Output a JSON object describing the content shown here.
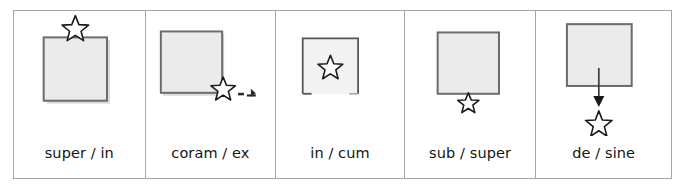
{
  "figure": {
    "type": "preposition-schema-table",
    "columns": [
      {
        "id": "col-1",
        "label": "super / in",
        "schema": "star above square",
        "star_position": "above-top-center",
        "square": {
          "fill": "#ebebeb",
          "border": "#6b6b6b",
          "shadow": true,
          "bottom_open": false
        },
        "arrow": false,
        "trail_marks": false
      },
      {
        "id": "col-2",
        "label": "coram / ex",
        "schema": "star at bottom-right corner of square with trailing marks",
        "star_position": "bottom-right-corner",
        "square": {
          "fill": "#ebebeb",
          "border": "#6b6b6b",
          "shadow": true,
          "bottom_open": false
        },
        "arrow": false,
        "trail_marks": true
      },
      {
        "id": "col-3",
        "label": "in / cum",
        "schema": "star inside square with open bottom edge",
        "star_position": "inside-center",
        "square": {
          "fill": "#f2f2f2",
          "border": "#555555",
          "shadow": false,
          "bottom_open": true
        },
        "arrow": false,
        "trail_marks": false
      },
      {
        "id": "col-4",
        "label": "sub / super",
        "schema": "star below square touching bottom edge",
        "star_position": "below-touching",
        "square": {
          "fill": "#ebebeb",
          "border": "#6b6b6b",
          "shadow": false,
          "bottom_open": false
        },
        "arrow": false,
        "trail_marks": false
      },
      {
        "id": "col-5",
        "label": "de / sine",
        "schema": "arrow from inside square pointing down to star below",
        "star_position": "below-detached",
        "square": {
          "fill": "#ebebeb",
          "border": "#6b6b6b",
          "shadow": false,
          "bottom_open": false
        },
        "arrow": true,
        "trail_marks": false
      }
    ],
    "colors": {
      "table_border": "#a6a6a6",
      "square_fill": "#ebebeb",
      "square_border": "#6b6b6b",
      "star_outline": "#1a1a1a",
      "arrow": "#3a3a3a",
      "text": "#141414",
      "background": "#ffffff"
    }
  }
}
